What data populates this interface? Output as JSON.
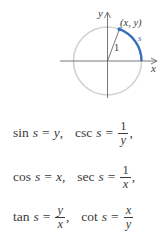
{
  "figure": {
    "axis_x_label": "x",
    "axis_y_label": "y",
    "point_label": "(x, y)",
    "radius_label": "1",
    "arc_label": "s",
    "colors": {
      "circle": "#d2d2d2",
      "axes": "#555555",
      "arc": "#3a70bb",
      "text": "#3a3a3a"
    }
  },
  "equations": [
    {
      "left": {
        "fn": "sin",
        "var": "s",
        "eq": "=",
        "rhs": "y",
        "punct": ","
      },
      "right": {
        "fn": "csc",
        "var": "s",
        "eq": "=",
        "num": "1",
        "den": "y",
        "punct": ","
      }
    },
    {
      "left": {
        "fn": "cos",
        "var": "s",
        "eq": "=",
        "rhs": "x",
        "punct": ","
      },
      "right": {
        "fn": "sec",
        "var": "s",
        "eq": "=",
        "num": "1",
        "den": "x",
        "punct": ","
      }
    },
    {
      "left": {
        "fn": "tan",
        "var": "s",
        "eq": "=",
        "num": "y",
        "den": "x",
        "punct": ","
      },
      "right": {
        "fn": "cot",
        "var": "s",
        "eq": "=",
        "num": "x",
        "den": "y",
        "punct": ""
      }
    }
  ]
}
